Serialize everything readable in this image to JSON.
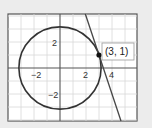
{
  "figure": {
    "type": "circle-with-tangent-line",
    "background_color": "#ececec",
    "plot_background_color": "#ffffff",
    "grid_color": "#d8d8d8",
    "axis_color": "#555555",
    "curve_color": "#333333"
  },
  "axes": {
    "x_range": [
      -4,
      6
    ],
    "y_range": [
      -4,
      4
    ],
    "grid_step": 1,
    "x_tick_labels": [
      {
        "value": -2,
        "label": "−2"
      },
      {
        "value": 2,
        "label": "2"
      },
      {
        "value": 4,
        "label": "4"
      }
    ],
    "y_tick_labels": [
      {
        "value": 2,
        "label": "2"
      },
      {
        "value": -2,
        "label": "−2"
      }
    ]
  },
  "circle": {
    "center": [
      0,
      0
    ],
    "radius_squared": 10,
    "equation": "x^2 + y^2 = 10"
  },
  "tangent_line": {
    "slope": -3,
    "intercept": 10,
    "equation": "y = -3x + 10"
  },
  "point": {
    "x": 3,
    "y": 1,
    "label": "(3, 1)"
  }
}
